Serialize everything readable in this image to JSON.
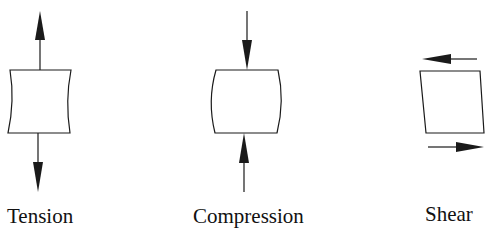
{
  "diagram": {
    "panels": [
      {
        "id": "tension",
        "label": "Tension",
        "shape": "concave-sided block",
        "arrows": "outward (pulling up and down)"
      },
      {
        "id": "compression",
        "label": "Compression",
        "shape": "convex-sided block",
        "arrows": "inward (pushing down and up)"
      },
      {
        "id": "shear",
        "label": "Shear",
        "shape": "skewed parallelogram",
        "arrows": "top left, bottom right"
      }
    ],
    "colors": {
      "stroke": "#1a1a1a",
      "fill": "#ffffff",
      "background": "#ffffff"
    }
  }
}
